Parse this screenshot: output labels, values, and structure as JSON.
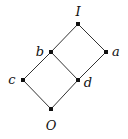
{
  "diagram": {
    "type": "hasse-diagram",
    "nodes": [
      {
        "id": "I",
        "label": "I",
        "x": 78,
        "y": 24,
        "lx": 78,
        "ly": 16
      },
      {
        "id": "b",
        "label": "b",
        "x": 51,
        "y": 52,
        "lx": 40,
        "ly": 56
      },
      {
        "id": "a",
        "label": "a",
        "x": 106,
        "y": 52,
        "lx": 116,
        "ly": 56
      },
      {
        "id": "c",
        "label": "c",
        "x": 23,
        "y": 80,
        "lx": 12,
        "ly": 84
      },
      {
        "id": "d",
        "label": "d",
        "x": 78,
        "y": 80,
        "lx": 88,
        "ly": 87
      },
      {
        "id": "O",
        "label": "O",
        "x": 51,
        "y": 109,
        "lx": 51,
        "ly": 130
      }
    ],
    "edges": [
      [
        "I",
        "b"
      ],
      [
        "I",
        "a"
      ],
      [
        "b",
        "c"
      ],
      [
        "b",
        "d"
      ],
      [
        "a",
        "d"
      ],
      [
        "c",
        "O"
      ],
      [
        "d",
        "O"
      ]
    ],
    "colors": {
      "line": "#333333",
      "node": "#111111"
    }
  }
}
